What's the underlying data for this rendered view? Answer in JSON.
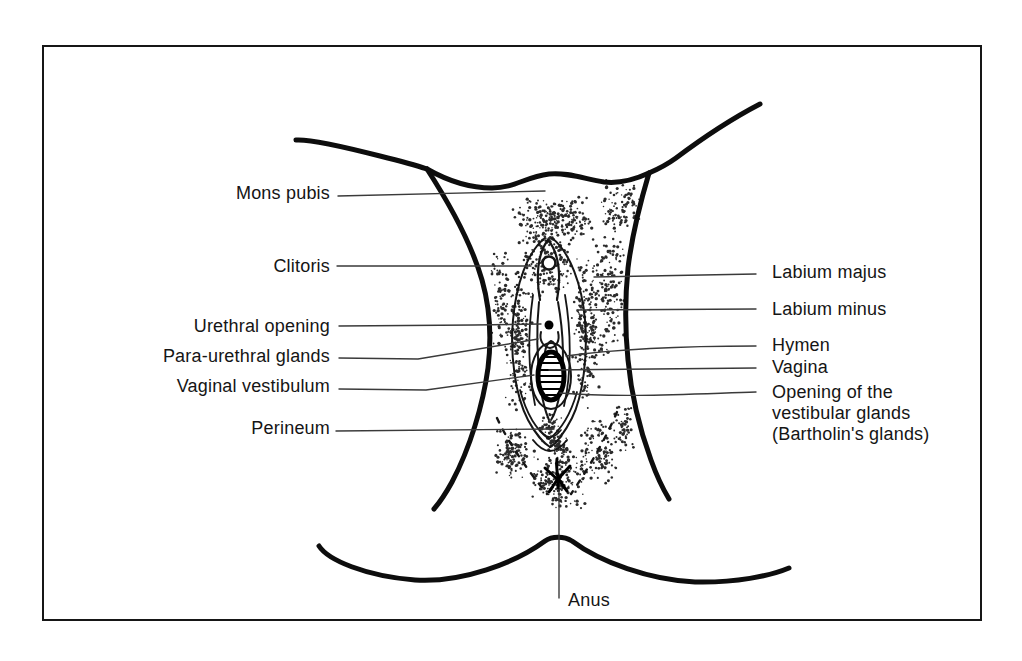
{
  "figure_type": "anatomical line illustration, external female genitalia, anterior view",
  "colors": {
    "paper": "#ffffff",
    "ink": "#111111",
    "leader_line": "#3a3a3a",
    "frame_border": "#161616"
  },
  "labels": {
    "left": [
      {
        "text": "Mons pubis"
      },
      {
        "text": "Clitoris"
      },
      {
        "text": "Urethral opening"
      },
      {
        "text": "Para-urethral glands"
      },
      {
        "text": "Vaginal vestibulum"
      },
      {
        "text": "Perineum"
      }
    ],
    "right": [
      {
        "text": "Labium majus"
      },
      {
        "text": "Labium minus"
      },
      {
        "text": "Hymen"
      },
      {
        "text": "Vagina"
      },
      {
        "line1": "Opening of the",
        "line2": "vestibular glands",
        "line3": "(Bartholin's glands)"
      }
    ],
    "bottom": {
      "text": "Anus"
    }
  }
}
